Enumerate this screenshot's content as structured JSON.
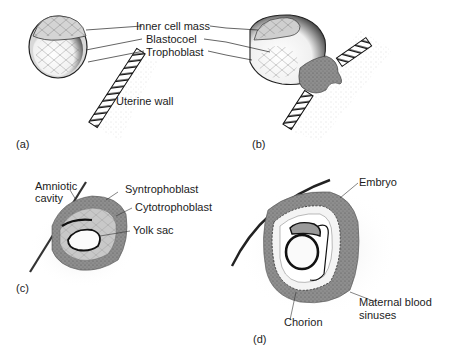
{
  "figure": {
    "panels": [
      {
        "id": "a",
        "tag": "(a)",
        "labels": [
          "Inner cell mass",
          "Blastocoel",
          "Trophoblast",
          "Uterine wall"
        ]
      },
      {
        "id": "b",
        "tag": "(b)",
        "labels": []
      },
      {
        "id": "c",
        "tag": "(c)",
        "labels": [
          "Amniotic",
          "cavity",
          "Syntrophoblast",
          "Cytotrophoblast",
          "Yolk sac"
        ]
      },
      {
        "id": "d",
        "tag": "(d)",
        "labels": [
          "Embryo",
          "Maternal blood",
          "sinuses",
          "Chorion"
        ]
      }
    ],
    "colors": {
      "ink": "#1a1a1a",
      "tissue_gray": "#9a9a9a",
      "light_tissue": "#cfcfcf",
      "stipple": "#bdbdbd",
      "background": "#ffffff"
    }
  }
}
